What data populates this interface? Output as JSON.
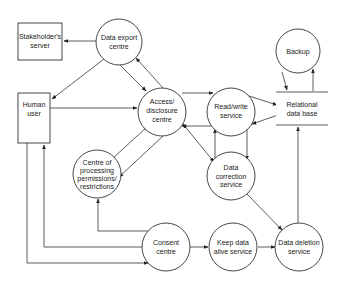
{
  "diagram": {
    "type": "data-flow-diagram",
    "nodes": {
      "stakeholder_server": {
        "lines": [
          "Stakeholder's",
          "server"
        ],
        "shape": "rectangle"
      },
      "data_export": {
        "lines": [
          "Data export",
          "centre"
        ],
        "shape": "circle"
      },
      "human_user": {
        "lines": [
          "Human",
          "user"
        ],
        "shape": "rectangle"
      },
      "access_disclosure": {
        "lines": [
          "Access/",
          "disclosure",
          "centre"
        ],
        "shape": "circle"
      },
      "read_write": {
        "lines": [
          "Read/write",
          "service"
        ],
        "shape": "circle"
      },
      "relational_db": {
        "lines": [
          "Relational",
          "data base"
        ],
        "shape": "datastore"
      },
      "backup": {
        "lines": [
          "Backup"
        ],
        "shape": "circle"
      },
      "processing_permissions": {
        "lines": [
          "Centre of",
          "processing",
          "permissions/",
          "restrictions"
        ],
        "shape": "circle"
      },
      "data_correction": {
        "lines": [
          "Data",
          "correction",
          "service"
        ],
        "shape": "circle"
      },
      "consent": {
        "lines": [
          "Consent",
          "centre"
        ],
        "shape": "circle"
      },
      "keep_alive": {
        "lines": [
          "Keep data",
          "alive service"
        ],
        "shape": "circle"
      },
      "data_deletion": {
        "lines": [
          "Data deletion",
          "service"
        ],
        "shape": "circle"
      }
    },
    "edges": [
      {
        "from": "data_export",
        "to": "stakeholder_server"
      },
      {
        "from": "data_export",
        "to": "human_user"
      },
      {
        "from": "data_export",
        "to": "access_disclosure"
      },
      {
        "from": "access_disclosure",
        "to": "data_export"
      },
      {
        "from": "human_user",
        "to": "access_disclosure"
      },
      {
        "from": "access_disclosure",
        "to": "read_write"
      },
      {
        "from": "read_write",
        "to": "access_disclosure"
      },
      {
        "from": "read_write",
        "to": "relational_db"
      },
      {
        "from": "relational_db",
        "to": "read_write"
      },
      {
        "from": "backup",
        "to": "relational_db"
      },
      {
        "from": "relational_db",
        "to": "backup"
      },
      {
        "from": "access_disclosure",
        "to": "processing_permissions"
      },
      {
        "from": "processing_permissions",
        "to": "access_disclosure"
      },
      {
        "from": "access_disclosure",
        "to": "data_correction"
      },
      {
        "from": "data_correction",
        "to": "access_disclosure"
      },
      {
        "from": "read_write",
        "to": "data_correction"
      },
      {
        "from": "data_correction",
        "to": "read_write"
      },
      {
        "from": "data_correction",
        "to": "data_deletion"
      },
      {
        "from": "consent",
        "to": "processing_permissions"
      },
      {
        "from": "consent",
        "to": "human_user"
      },
      {
        "from": "human_user",
        "to": "consent"
      },
      {
        "from": "consent",
        "to": "keep_alive"
      },
      {
        "from": "keep_alive",
        "to": "data_deletion"
      },
      {
        "from": "data_deletion",
        "to": "relational_db"
      }
    ]
  }
}
